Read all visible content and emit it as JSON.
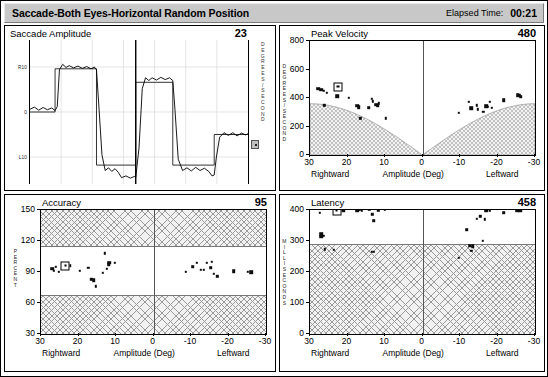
{
  "header": {
    "title": "Saccade-Both Eyes-Horizontal Random Position",
    "elapsed_label": "Elapsed Time:",
    "elapsed_value": "00:21"
  },
  "panels": {
    "amplitude": {
      "title": "Saccade Amplitude",
      "value": "23",
      "ylabel_right": "DEGREES/SECOND",
      "yticks": [
        "R10",
        "0",
        "L10"
      ]
    },
    "peak_velocity": {
      "title": "Peak Velocity",
      "value": "480",
      "ylabel": "DEGREES/SECOND",
      "xlabel": "Amplitude (Deg)",
      "xcap_left": "Rightward",
      "xcap_right": "Leftward"
    },
    "accuracy": {
      "title": "Accuracy",
      "value": "95",
      "ylabel": "PERCENT",
      "xlabel": "Amplitude (Deg)",
      "xcap_left": "Rightward",
      "xcap_right": "Leftward"
    },
    "latency": {
      "title": "Latency",
      "value": "458",
      "ylabel": "MILLISECONDS",
      "xlabel": "Amplitude (Deg)",
      "xcap_left": "Rightward",
      "xcap_right": "Leftward"
    }
  },
  "colors": {
    "titlebar": "#c8c8c8",
    "trace": "#000000",
    "marker": "#0d0d0d",
    "normal_band": "#f2f2f2",
    "panel_border": "#000000"
  },
  "chart_data": [
    {
      "id": "amplitude",
      "type": "line",
      "title": "Saccade Amplitude",
      "value": 23,
      "ylabel": "Degrees",
      "ytick_labels": [
        "R10",
        "0",
        "L10"
      ],
      "ytick_values": [
        10,
        0,
        -10
      ],
      "ylim": [
        -16,
        16
      ],
      "xlabel": "",
      "grid": true,
      "series": [
        {
          "name": "target",
          "step": true,
          "points": [
            [
              0.0,
              0.0
            ],
            [
              0.115,
              0.0
            ],
            [
              0.115,
              9.6
            ],
            [
              0.305,
              9.6
            ],
            [
              0.305,
              -11.8
            ],
            [
              0.485,
              -11.8
            ],
            [
              0.485,
              6.6
            ],
            [
              0.655,
              6.6
            ],
            [
              0.655,
              -11.8
            ],
            [
              0.845,
              -11.8
            ],
            [
              0.845,
              -5.0
            ],
            [
              1.0,
              -5.0
            ]
          ]
        },
        {
          "name": "eye",
          "step": false,
          "points": [
            [
              0.0,
              0.6
            ],
            [
              0.02,
              1.1
            ],
            [
              0.04,
              0.4
            ],
            [
              0.06,
              1.0
            ],
            [
              0.08,
              0.5
            ],
            [
              0.1,
              0.9
            ],
            [
              0.115,
              0.3
            ],
            [
              0.125,
              1.2
            ],
            [
              0.135,
              9.4
            ],
            [
              0.15,
              10.6
            ],
            [
              0.165,
              9.9
            ],
            [
              0.18,
              10.3
            ],
            [
              0.2,
              9.8
            ],
            [
              0.22,
              10.2
            ],
            [
              0.24,
              9.7
            ],
            [
              0.26,
              10.1
            ],
            [
              0.28,
              9.6
            ],
            [
              0.295,
              10.0
            ],
            [
              0.305,
              9.4
            ],
            [
              0.315,
              2.0
            ],
            [
              0.33,
              -9.5
            ],
            [
              0.345,
              -13.0
            ],
            [
              0.36,
              -12.4
            ],
            [
              0.375,
              -13.2
            ],
            [
              0.39,
              -12.6
            ],
            [
              0.405,
              -13.4
            ],
            [
              0.42,
              -14.6
            ],
            [
              0.44,
              -14.2
            ],
            [
              0.46,
              -14.7
            ],
            [
              0.48,
              -14.3
            ],
            [
              0.485,
              -14.6
            ],
            [
              0.5,
              -8.0
            ],
            [
              0.515,
              5.2
            ],
            [
              0.53,
              7.6
            ],
            [
              0.545,
              7.0
            ],
            [
              0.56,
              7.6
            ],
            [
              0.58,
              7.1
            ],
            [
              0.6,
              7.7
            ],
            [
              0.62,
              7.2
            ],
            [
              0.64,
              7.6
            ],
            [
              0.655,
              7.0
            ],
            [
              0.665,
              0.5
            ],
            [
              0.68,
              -10.5
            ],
            [
              0.7,
              -13.0
            ],
            [
              0.72,
              -12.4
            ],
            [
              0.74,
              -13.1
            ],
            [
              0.76,
              -12.3
            ],
            [
              0.78,
              -13.0
            ],
            [
              0.8,
              -12.5
            ],
            [
              0.82,
              -13.2
            ],
            [
              0.835,
              -14.2
            ],
            [
              0.845,
              -14.0
            ],
            [
              0.855,
              -10.0
            ],
            [
              0.87,
              -5.6
            ],
            [
              0.89,
              -4.6
            ],
            [
              0.91,
              -5.2
            ],
            [
              0.93,
              -4.6
            ],
            [
              0.95,
              -5.3
            ],
            [
              0.97,
              -4.7
            ],
            [
              0.99,
              -5.1
            ],
            [
              1.0,
              -4.8
            ]
          ]
        }
      ]
    },
    {
      "id": "peak_velocity",
      "type": "scatter",
      "title": "Peak Velocity",
      "value": 480,
      "ylabel": "DEGREES/SECOND",
      "ylim": [
        0,
        800
      ],
      "yticks": [
        0,
        200,
        400,
        600,
        800
      ],
      "xlabel": "Amplitude (Deg)",
      "xlim": [
        30,
        -30
      ],
      "xticks": [
        30,
        20,
        10,
        0,
        -10,
        -20,
        -30
      ],
      "xcap_left": "Rightward",
      "xcap_right": "Leftward",
      "normal_region": "below main-sequence curve (hatched)",
      "cursor_marker": {
        "x": 22.5,
        "y": 480
      },
      "points": [
        {
          "x": 27.8,
          "y": 465,
          "size": "md"
        },
        {
          "x": 27.0,
          "y": 458,
          "size": "md"
        },
        {
          "x": 26.4,
          "y": 452,
          "size": "sm"
        },
        {
          "x": 25.6,
          "y": 437,
          "size": "sm"
        },
        {
          "x": 26.2,
          "y": 348,
          "size": "sm"
        },
        {
          "x": 22.8,
          "y": 413,
          "size": "md"
        },
        {
          "x": 19.6,
          "y": 400,
          "size": "sm"
        },
        {
          "x": 17.4,
          "y": 345,
          "size": "md"
        },
        {
          "x": 17.0,
          "y": 337,
          "size": "md"
        },
        {
          "x": 16.6,
          "y": 258,
          "size": "sm"
        },
        {
          "x": 13.6,
          "y": 395,
          "size": "sm"
        },
        {
          "x": 13.2,
          "y": 378,
          "size": "sm"
        },
        {
          "x": 12.4,
          "y": 352,
          "size": "md"
        },
        {
          "x": 12.0,
          "y": 345,
          "size": "md"
        },
        {
          "x": 11.6,
          "y": 362,
          "size": "sm"
        },
        {
          "x": 14.4,
          "y": 332,
          "size": "md"
        },
        {
          "x": 9.8,
          "y": 258,
          "size": "sm"
        },
        {
          "x": -9.6,
          "y": 297,
          "size": "sm"
        },
        {
          "x": -12.4,
          "y": 372,
          "size": "sm"
        },
        {
          "x": -13.0,
          "y": 330,
          "size": "md"
        },
        {
          "x": -14.4,
          "y": 350,
          "size": "sm"
        },
        {
          "x": -14.8,
          "y": 320,
          "size": "sm"
        },
        {
          "x": -16.2,
          "y": 303,
          "size": "sm"
        },
        {
          "x": -17.0,
          "y": 343,
          "size": "md"
        },
        {
          "x": -17.4,
          "y": 337,
          "size": "sm"
        },
        {
          "x": -18.4,
          "y": 330,
          "size": "sm"
        },
        {
          "x": -18.0,
          "y": 372,
          "size": "sm"
        },
        {
          "x": -21.6,
          "y": 385,
          "size": "md"
        },
        {
          "x": -25.4,
          "y": 418,
          "size": "md"
        },
        {
          "x": -26.2,
          "y": 410,
          "size": "md"
        },
        {
          "x": -26.0,
          "y": 420,
          "size": "sm"
        }
      ]
    },
    {
      "id": "accuracy",
      "type": "scatter",
      "title": "Accuracy",
      "value": 95,
      "ylabel": "PERCENT",
      "ylim": [
        30,
        150
      ],
      "yticks": [
        30,
        60,
        90,
        120,
        150
      ],
      "xlabel": "Amplitude (Deg)",
      "xlim": [
        30,
        -30
      ],
      "xticks": [
        30,
        20,
        10,
        0,
        -10,
        -20,
        -30
      ],
      "xcap_left": "Rightward",
      "xcap_right": "Leftward",
      "normal_band": [
        68,
        115
      ],
      "cursor_marker": {
        "x": 23.5,
        "y": 96
      },
      "points": [
        {
          "x": 27.0,
          "y": 93,
          "size": "md"
        },
        {
          "x": 26.6,
          "y": 91,
          "size": "sm"
        },
        {
          "x": 26.0,
          "y": 95,
          "size": "sm"
        },
        {
          "x": 25.2,
          "y": 90,
          "size": "sm"
        },
        {
          "x": 24.4,
          "y": 94,
          "size": "sm"
        },
        {
          "x": 23.8,
          "y": 95,
          "size": "md"
        },
        {
          "x": 23.0,
          "y": 96,
          "size": "md"
        },
        {
          "x": 22.4,
          "y": 96,
          "size": "md"
        },
        {
          "x": 19.6,
          "y": 91,
          "size": "sm"
        },
        {
          "x": 17.4,
          "y": 94,
          "size": "sm"
        },
        {
          "x": 16.6,
          "y": 83,
          "size": "sm"
        },
        {
          "x": 16.0,
          "y": 82,
          "size": "md"
        },
        {
          "x": 15.4,
          "y": 76,
          "size": "sm"
        },
        {
          "x": 13.6,
          "y": 89,
          "size": "sm"
        },
        {
          "x": 13.0,
          "y": 108,
          "size": "sm"
        },
        {
          "x": 12.4,
          "y": 93,
          "size": "sm"
        },
        {
          "x": 12.0,
          "y": 97,
          "size": "md"
        },
        {
          "x": 11.8,
          "y": 99,
          "size": "md"
        },
        {
          "x": 10.4,
          "y": 99,
          "size": "sm"
        },
        {
          "x": -8.6,
          "y": 90,
          "size": "sm"
        },
        {
          "x": -10.4,
          "y": 95,
          "size": "md"
        },
        {
          "x": -11.6,
          "y": 99,
          "size": "sm"
        },
        {
          "x": -12.6,
          "y": 92,
          "size": "sm"
        },
        {
          "x": -13.4,
          "y": 92,
          "size": "sm"
        },
        {
          "x": -14.2,
          "y": 99,
          "size": "sm"
        },
        {
          "x": -15.2,
          "y": 94,
          "size": "md"
        },
        {
          "x": -15.6,
          "y": 100,
          "size": "sm"
        },
        {
          "x": -16.0,
          "y": 88,
          "size": "sm"
        },
        {
          "x": -17.0,
          "y": 86,
          "size": "sm"
        },
        {
          "x": -21.4,
          "y": 91,
          "size": "md"
        },
        {
          "x": -25.2,
          "y": 90,
          "size": "sm"
        },
        {
          "x": -26.0,
          "y": 90,
          "size": "md"
        }
      ]
    },
    {
      "id": "latency",
      "type": "scatter",
      "title": "Latency",
      "value": 458,
      "ylabel": "MILLISECONDS",
      "ylim": [
        0,
        400
      ],
      "yticks": [
        0,
        100,
        200,
        300,
        400
      ],
      "xlabel": "Amplitude (Deg)",
      "xlim": [
        30,
        -30
      ],
      "xticks": [
        30,
        20,
        10,
        0,
        -10,
        -20,
        -30
      ],
      "xcap_left": "Rightward",
      "xcap_right": "Leftward",
      "normal_band": [
        290,
        400
      ],
      "cursor_marker": {
        "x": 22.8,
        "y": 398
      },
      "points": [
        {
          "x": 27.4,
          "y": 390,
          "size": "sm"
        },
        {
          "x": 27.0,
          "y": 322,
          "size": "md"
        },
        {
          "x": 27.0,
          "y": 314,
          "size": "md"
        },
        {
          "x": 26.4,
          "y": 316,
          "size": "sm"
        },
        {
          "x": 26.0,
          "y": 273,
          "size": "sm"
        },
        {
          "x": 23.6,
          "y": 272,
          "size": "sm"
        },
        {
          "x": 22.6,
          "y": 398,
          "size": "md"
        },
        {
          "x": 21.2,
          "y": 399,
          "size": "md"
        },
        {
          "x": 17.4,
          "y": 400,
          "size": "md"
        },
        {
          "x": 16.8,
          "y": 400,
          "size": "sm"
        },
        {
          "x": 16.2,
          "y": 399,
          "size": "sm"
        },
        {
          "x": 14.2,
          "y": 400,
          "size": "sm"
        },
        {
          "x": 13.4,
          "y": 386,
          "size": "sm"
        },
        {
          "x": 13.0,
          "y": 365,
          "size": "md"
        },
        {
          "x": 13.6,
          "y": 266,
          "size": "sm"
        },
        {
          "x": 13.0,
          "y": 265,
          "size": "sm"
        },
        {
          "x": 11.8,
          "y": 399,
          "size": "sm"
        },
        {
          "x": 10.0,
          "y": 400,
          "size": "sm"
        },
        {
          "x": -9.6,
          "y": 245,
          "size": "sm"
        },
        {
          "x": -11.8,
          "y": 336,
          "size": "md"
        },
        {
          "x": -12.6,
          "y": 285,
          "size": "md"
        },
        {
          "x": -13.4,
          "y": 283,
          "size": "md"
        },
        {
          "x": -13.0,
          "y": 268,
          "size": "sm"
        },
        {
          "x": -14.4,
          "y": 371,
          "size": "sm"
        },
        {
          "x": -15.4,
          "y": 380,
          "size": "sm"
        },
        {
          "x": -16.0,
          "y": 300,
          "size": "sm"
        },
        {
          "x": -16.6,
          "y": 370,
          "size": "sm"
        },
        {
          "x": -17.0,
          "y": 398,
          "size": "md"
        },
        {
          "x": -18.0,
          "y": 399,
          "size": "sm"
        },
        {
          "x": -21.6,
          "y": 391,
          "size": "md"
        },
        {
          "x": -25.2,
          "y": 398,
          "size": "md"
        },
        {
          "x": -26.0,
          "y": 399,
          "size": "md"
        }
      ]
    }
  ]
}
